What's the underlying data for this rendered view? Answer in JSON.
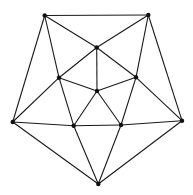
{
  "diagram": {
    "type": "planar-graph",
    "width": 193,
    "height": 195,
    "colors": {
      "edge": "#1a1a1a",
      "node": "#111111",
      "background": "#ffffff"
    },
    "nodes": [
      {
        "id": "TL",
        "x": 44.7,
        "y": 15.5
      },
      {
        "id": "TR",
        "x": 148.3,
        "y": 15
      },
      {
        "id": "TC",
        "x": 96.7,
        "y": 47.5
      },
      {
        "id": "ML",
        "x": 59,
        "y": 77.7
      },
      {
        "id": "MR",
        "x": 136,
        "y": 77.3
      },
      {
        "id": "C",
        "x": 97,
        "y": 91
      },
      {
        "id": "OL",
        "x": 12.7,
        "y": 122
      },
      {
        "id": "OR",
        "x": 182,
        "y": 120.7
      },
      {
        "id": "LI",
        "x": 73.7,
        "y": 125.7
      },
      {
        "id": "RI",
        "x": 121,
        "y": 125
      },
      {
        "id": "B",
        "x": 98.3,
        "y": 184
      }
    ],
    "edges": [
      [
        "TL",
        "TR"
      ],
      [
        "TL",
        "OL"
      ],
      [
        "TL",
        "TC"
      ],
      [
        "TL",
        "ML"
      ],
      [
        "ML",
        "LI"
      ],
      [
        "TR",
        "OR"
      ],
      [
        "TR",
        "TC"
      ],
      [
        "TR",
        "MR"
      ],
      [
        "MR",
        "RI"
      ],
      [
        "TC",
        "C"
      ],
      [
        "TC",
        "ML"
      ],
      [
        "TC",
        "MR"
      ],
      [
        "ML",
        "OL"
      ],
      [
        "ML",
        "C"
      ],
      [
        "MR",
        "OR"
      ],
      [
        "MR",
        "C"
      ],
      [
        "C",
        "LI"
      ],
      [
        "C",
        "RI"
      ],
      [
        "OL",
        "LI"
      ],
      [
        "LI",
        "RI"
      ],
      [
        "RI",
        "OR"
      ],
      [
        "OL",
        "B"
      ],
      [
        "LI",
        "B"
      ],
      [
        "RI",
        "B"
      ],
      [
        "OR",
        "B"
      ]
    ]
  }
}
